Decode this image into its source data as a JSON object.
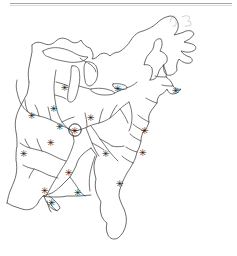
{
  "figure": {
    "kind": "scanned-line-map",
    "alt_text": "Black and white line drawing map of eastern North America showing the Great Lakes, Atlantic and Gulf coastlines, Florida, and the Mississippi-Ohio-Missouri-Tennessee river network, annotated with asterisk site markers and one circled marker",
    "width_px": 237,
    "height_px": 256,
    "background_color": "#ffffff",
    "ink_color": "#3a3a3a",
    "marker_color": "#111111",
    "rule_color": "#9a9a9a"
  },
  "page_furniture": {
    "top_rule_label": "page header rule",
    "scan_artifact_label": "faint handwritten scan artifact"
  },
  "map": {
    "region_label": "Eastern North America",
    "features": {
      "coastline_label": "coastline and international boundary outline",
      "lakes_label": "Great Lakes outlines",
      "rivers_label": "river network"
    },
    "named_regions": [
      "Lake Superior",
      "Lake Michigan",
      "Lake Huron",
      "Lake Erie",
      "Lake Ontario",
      "St. Lawrence River",
      "Nova Scotia",
      "Maine",
      "Chesapeake Bay",
      "Florida Peninsula",
      "Gulf Coast",
      "Mississippi River",
      "Missouri River",
      "Ohio River",
      "Tennessee River",
      "Arkansas River",
      "Mississippi Delta"
    ]
  },
  "markers": {
    "symbol": "✳",
    "highlight_symbol": "circled-asterisk",
    "count": 18,
    "highlighted_count": 1,
    "legend_note": "asterisk marks a site; circled asterisk marks the highlighted site",
    "points": [
      {
        "id": "m01",
        "x": 65,
        "y": 87,
        "highlighted": false,
        "label": "upper midwest site"
      },
      {
        "id": "m02",
        "x": 54,
        "y": 108,
        "highlighted": false,
        "label": "upper mississippi site"
      },
      {
        "id": "m03",
        "x": 32,
        "y": 115,
        "highlighted": false,
        "label": "missouri river site"
      },
      {
        "id": "m04",
        "x": 91,
        "y": 117,
        "highlighted": false,
        "label": "ohio valley site"
      },
      {
        "id": "m05",
        "x": 60,
        "y": 126,
        "highlighted": false,
        "label": "mid mississippi site"
      },
      {
        "id": "m06",
        "x": 75,
        "y": 130,
        "highlighted": true,
        "label": "highlighted confluence site"
      },
      {
        "id": "m07",
        "x": 51,
        "y": 142,
        "highlighted": false,
        "label": "lower missouri site"
      },
      {
        "id": "m08",
        "x": 24,
        "y": 153,
        "highlighted": false,
        "label": "arkansas river site"
      },
      {
        "id": "m09",
        "x": 106,
        "y": 153,
        "highlighted": false,
        "label": "tennessee valley site"
      },
      {
        "id": "m10",
        "x": 145,
        "y": 130,
        "highlighted": false,
        "label": "chesapeake site"
      },
      {
        "id": "m11",
        "x": 143,
        "y": 152,
        "highlighted": false,
        "label": "carolina coastal site"
      },
      {
        "id": "m12",
        "x": 118,
        "y": 88,
        "highlighted": false,
        "label": "northeast interior site"
      },
      {
        "id": "m13",
        "x": 176,
        "y": 90,
        "highlighted": false,
        "label": "new england coastal site"
      },
      {
        "id": "m14",
        "x": 69,
        "y": 172,
        "highlighted": false,
        "label": "lower south site"
      },
      {
        "id": "m15",
        "x": 45,
        "y": 190,
        "highlighted": false,
        "label": "lower mississippi site"
      },
      {
        "id": "m16",
        "x": 78,
        "y": 192,
        "highlighted": false,
        "label": "gulf coast site"
      },
      {
        "id": "m17",
        "x": 120,
        "y": 183,
        "highlighted": false,
        "label": "southeast coastal site"
      },
      {
        "id": "m18",
        "x": 52,
        "y": 202,
        "highlighted": false,
        "label": "delta site"
      }
    ]
  }
}
